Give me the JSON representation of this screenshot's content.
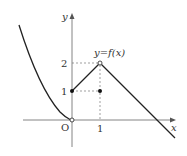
{
  "figure": {
    "function_label": "y=f(x)",
    "axis_x_label": "x",
    "axis_y_label": "y",
    "origin_label": "O",
    "y_ticks": [
      "1",
      "2"
    ],
    "x_ticks": [
      "1"
    ],
    "colors": {
      "curve": "#222222",
      "axis": "#555555",
      "dash": "#666666"
    }
  },
  "pieces": [
    {
      "name": "left-curve",
      "domain": "x<0",
      "description": "decreasing curve approaching origin (open)"
    },
    {
      "name": "rising-segment",
      "from": [
        0,
        1
      ],
      "to": [
        1,
        2
      ],
      "start": "closed",
      "end": "open"
    },
    {
      "name": "falling-ray",
      "from": [
        1,
        2
      ],
      "slope": -1,
      "description": "line through x-axis around x=3"
    }
  ],
  "points": [
    {
      "x": 0,
      "y": 0,
      "style": "open"
    },
    {
      "x": 0,
      "y": 1,
      "style": "closed"
    },
    {
      "x": 1,
      "y": 2,
      "style": "open"
    },
    {
      "x": 1,
      "y": 1,
      "style": "closed"
    }
  ]
}
